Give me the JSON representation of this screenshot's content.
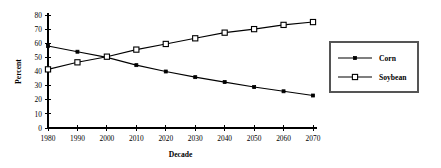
{
  "chart_data": {
    "type": "line",
    "title": "",
    "xlabel": "Decade",
    "ylabel": "Percent",
    "categories": [
      "1980",
      "1990",
      "2000",
      "2010",
      "2020",
      "2030",
      "2040",
      "2050",
      "2060",
      "2070"
    ],
    "x": [
      1980,
      1990,
      2000,
      2010,
      2020,
      2030,
      2040,
      2050,
      2060,
      2070
    ],
    "series": [
      {
        "name": "Corn",
        "marker": "filled-square",
        "color": "#000000",
        "values": [
          58,
          54,
          50,
          44.5,
          40,
          36,
          32.5,
          29,
          26,
          23
        ]
      },
      {
        "name": "Soybean",
        "marker": "open-square",
        "color": "#000000",
        "values": [
          41.5,
          46.5,
          50.5,
          55.5,
          59.5,
          63.5,
          67.5,
          70,
          73,
          75
        ]
      }
    ],
    "ylim": [
      0,
      80
    ],
    "yticks": [
      0,
      10,
      20,
      30,
      40,
      50,
      60,
      70,
      80
    ],
    "ytick_labels": [
      "0",
      "10",
      "20",
      "30",
      "40",
      "50",
      "60",
      "70",
      "80"
    ],
    "xlim": [
      1980,
      2070
    ],
    "grid": false,
    "legend_position": "right-outside"
  },
  "legend": {
    "entries": [
      {
        "label": "Corn"
      },
      {
        "label": "Soybean"
      }
    ]
  }
}
